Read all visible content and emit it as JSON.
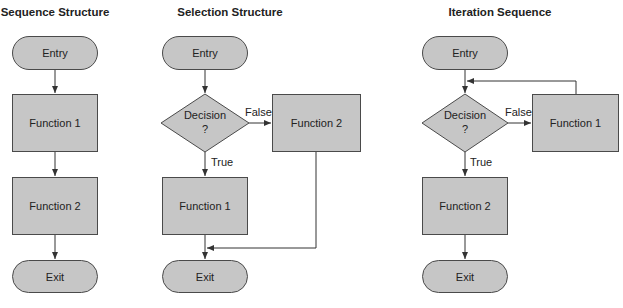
{
  "diagrams": [
    {
      "title": "Sequence Structure",
      "nodes": {
        "entry": "Entry",
        "function1": "Function 1",
        "function2": "Function 2",
        "exit": "Exit"
      }
    },
    {
      "title": "Selection Structure",
      "nodes": {
        "entry": "Entry",
        "decision": "Decision",
        "decision_mark": "?",
        "function1": "Function 1",
        "function2": "Function 2",
        "exit": "Exit"
      },
      "edges": {
        "true_label": "True",
        "false_label": "False"
      }
    },
    {
      "title": "Iteration Sequence",
      "nodes": {
        "entry": "Entry",
        "decision": "Decision",
        "decision_mark": "?",
        "function1": "Function 1",
        "function2": "Function 2",
        "exit": "Exit"
      },
      "edges": {
        "true_label": "True",
        "false_label": "False"
      }
    }
  ],
  "colors": {
    "node_fill": "#c6c6c6",
    "node_border": "#4a4a4a",
    "line": "#333333"
  }
}
